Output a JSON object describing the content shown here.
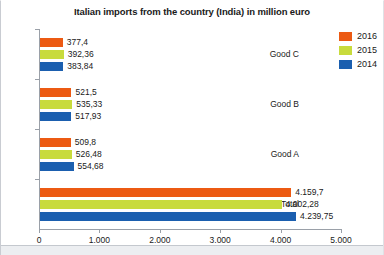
{
  "chart_data": {
    "type": "bar",
    "orientation": "horizontal",
    "title": "Italian imports from the country (India) in million euro",
    "xlabel": "",
    "ylabel": "",
    "categories": [
      "Total",
      "Good A",
      "Good B",
      "Good C"
    ],
    "series": [
      {
        "name": "2014",
        "color": "#1b5faf",
        "values": [
          4239.75,
          554.68,
          517.93,
          383.84
        ],
        "labels": [
          "4.239,75",
          "554,68",
          "517,93",
          "383,84"
        ]
      },
      {
        "name": "2015",
        "color": "#c8db3c",
        "values": [
          4002.28,
          526.48,
          535.33,
          392.36
        ],
        "labels": [
          "4.002,28",
          "526,48",
          "535,33",
          "392,36"
        ]
      },
      {
        "name": "2016",
        "color": "#ec5a13",
        "values": [
          4159.7,
          509.8,
          521.5,
          377.4
        ],
        "labels": [
          "4.159,7",
          "509,8",
          "521,5",
          "377,4"
        ]
      }
    ],
    "xlim": [
      0,
      5000
    ],
    "xticks": [
      0,
      1000,
      2000,
      3000,
      4000,
      5000
    ],
    "xtick_labels": [
      "0",
      "1.000",
      "2.000",
      "3.000",
      "4.000",
      "5.000"
    ],
    "grid": false,
    "legend_position": "top-right",
    "legend_entries": [
      {
        "label": "2016",
        "color": "#ec5a13"
      },
      {
        "label": "2015",
        "color": "#c8db3c"
      },
      {
        "label": "2014",
        "color": "#1b5faf"
      }
    ]
  }
}
